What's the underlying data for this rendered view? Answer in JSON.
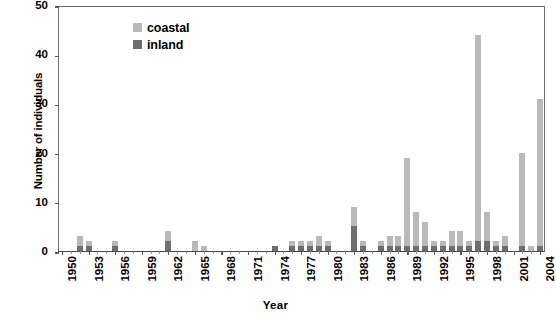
{
  "chart_data": {
    "type": "bar",
    "subtype": "stacked",
    "title": "",
    "xlabel": "Year",
    "ylabel": "Number of individuals",
    "ylim": [
      0,
      50
    ],
    "ytick_values": [
      0,
      10,
      20,
      30,
      40,
      50
    ],
    "xlim": [
      1950,
      2005
    ],
    "xtick_labels": [
      "1950",
      "1953",
      "1956",
      "1959",
      "1962",
      "1965",
      "1968",
      "1971",
      "1974",
      "1977",
      "1980",
      "1983",
      "1986",
      "1989",
      "1992",
      "1995",
      "1998",
      "2001",
      "2004"
    ],
    "grid": false,
    "legend_position": "top-left",
    "legend": [
      "coastal",
      "inland"
    ],
    "colors": {
      "coastal": "#b9b9b9",
      "inland": "#6e6e6e"
    },
    "categories": [
      1950,
      1951,
      1952,
      1953,
      1954,
      1955,
      1956,
      1957,
      1958,
      1959,
      1960,
      1961,
      1962,
      1963,
      1964,
      1965,
      1966,
      1967,
      1968,
      1969,
      1970,
      1971,
      1972,
      1973,
      1974,
      1975,
      1976,
      1977,
      1978,
      1979,
      1980,
      1981,
      1982,
      1983,
      1984,
      1985,
      1986,
      1987,
      1988,
      1989,
      1990,
      1991,
      1992,
      1993,
      1994,
      1995,
      1996,
      1997,
      1998,
      1999,
      2000,
      2001,
      2002,
      2003,
      2004
    ],
    "series": [
      {
        "name": "coastal",
        "values": [
          0,
          0,
          2,
          1,
          0,
          0,
          1,
          0,
          0,
          0,
          0,
          0,
          2,
          0,
          0,
          2,
          1,
          0,
          0,
          0,
          0,
          0,
          0,
          0,
          0,
          0,
          1,
          1,
          1,
          2,
          1,
          0,
          0,
          4,
          1,
          0,
          1,
          2,
          2,
          18,
          7,
          5,
          1,
          1,
          3,
          3,
          1,
          42,
          6,
          1,
          2,
          0,
          19,
          1,
          30
        ]
      },
      {
        "name": "inland",
        "values": [
          0,
          0,
          1,
          1,
          0,
          0,
          1,
          0,
          0,
          0,
          0,
          0,
          2,
          0,
          0,
          0,
          0,
          0,
          0,
          0,
          0,
          0,
          0,
          0,
          1,
          0,
          1,
          1,
          1,
          1,
          1,
          0,
          0,
          5,
          1,
          0,
          1,
          1,
          1,
          1,
          1,
          1,
          1,
          1,
          1,
          1,
          1,
          2,
          2,
          1,
          1,
          0,
          1,
          0,
          1
        ]
      }
    ]
  }
}
